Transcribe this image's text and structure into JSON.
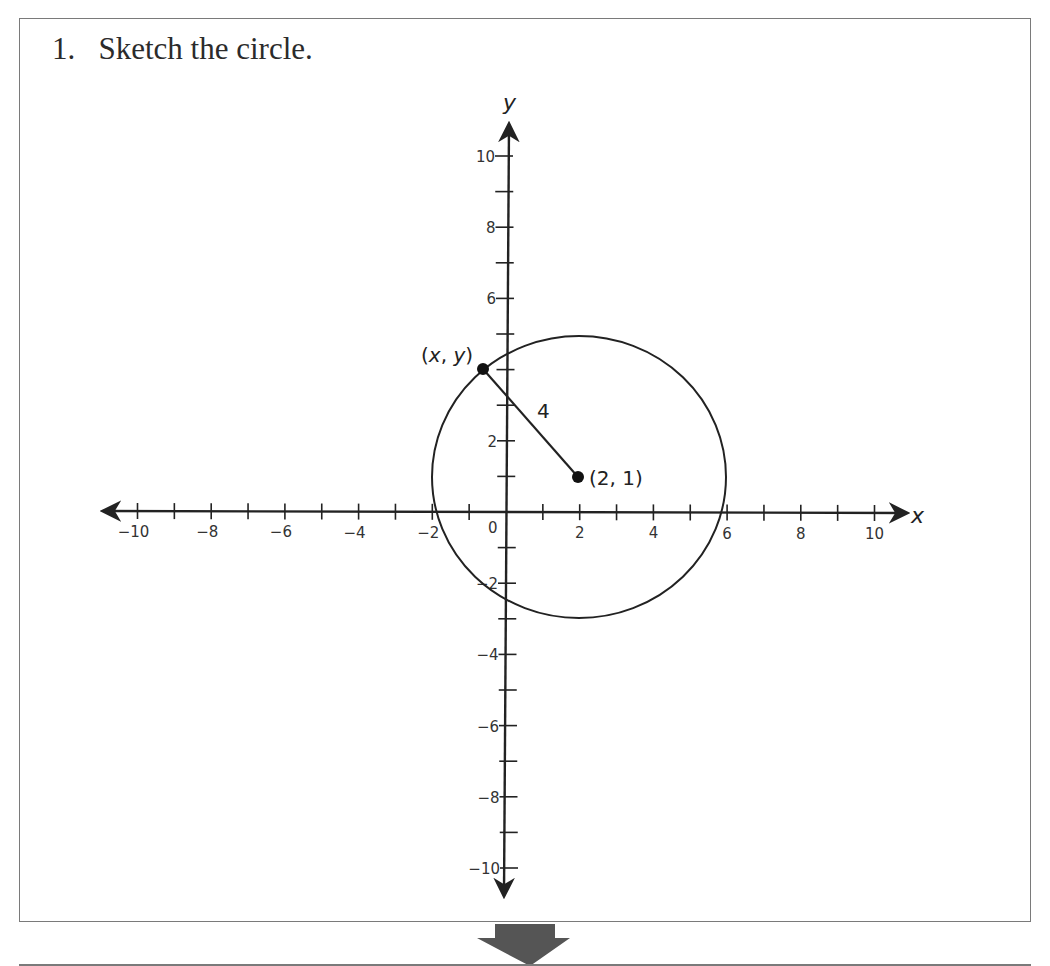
{
  "problem": {
    "number": "1.",
    "instruction": "Sketch the circle.",
    "title": "1.   Sketch the circle."
  },
  "colors": {
    "ink": "#222222",
    "border": "#7a7a7a",
    "arrow_fill": "#555555"
  },
  "chart_data": {
    "type": "scatter",
    "title": "Sketch the circle.",
    "xlabel": "x",
    "ylabel": "y",
    "xlim": [
      -10,
      10
    ],
    "ylim": [
      -10,
      10
    ],
    "grid": false,
    "x_tick_labels": [
      "-10",
      "-8",
      "-6",
      "-4",
      "-2",
      "0",
      "2",
      "4",
      "6",
      "8",
      "10"
    ],
    "y_tick_labels": [
      "10",
      "8",
      "6",
      "2",
      "-2",
      "-4",
      "-6",
      "-8",
      "-10"
    ],
    "minor_ticks_every": 1,
    "circle": {
      "center": [
        2,
        1
      ],
      "radius": 4
    },
    "points": [
      {
        "label": "(2, 1)",
        "x": 2,
        "y": 1,
        "role": "center"
      },
      {
        "label": "(x, y)",
        "x": -0.6,
        "y": 4,
        "role": "point-on-circle"
      }
    ],
    "segments": [
      {
        "from": [
          -0.6,
          4
        ],
        "to": [
          2,
          1
        ],
        "label": "4"
      }
    ],
    "annotations": [
      "(x, y)",
      "(2, 1)",
      "4"
    ]
  },
  "labels": {
    "x_axis": "x",
    "y_axis": "y",
    "origin": "0",
    "radius": "4",
    "center": "(2, 1)",
    "point": "(x, y)"
  }
}
